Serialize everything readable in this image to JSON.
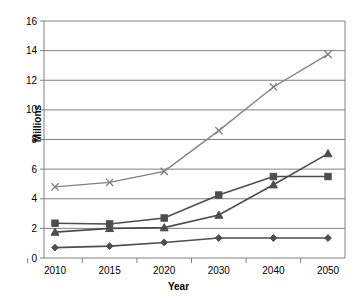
{
  "chart_data": {
    "type": "line",
    "title": "",
    "xlabel": "Year",
    "ylabel": "Millions",
    "x": [
      2010,
      2015,
      2020,
      2030,
      2040,
      2050
    ],
    "xtick_labels": [
      "2010",
      "2015",
      "2020",
      "2030",
      "2040",
      "2050"
    ],
    "ytick_labels": [
      "0",
      "2",
      "4",
      "6",
      "8",
      "10",
      "12",
      "14",
      "16"
    ],
    "ylim": [
      0,
      16
    ],
    "ytick_step": 2,
    "grid": "horizontal",
    "legend": "none",
    "series": [
      {
        "name": "series-diamond",
        "marker": "diamond",
        "color": "#4d4d4d",
        "values": [
          0.7,
          0.8,
          1.05,
          1.35,
          1.35,
          1.35
        ]
      },
      {
        "name": "series-square",
        "marker": "square",
        "color": "#4d4d4d",
        "values": [
          2.35,
          2.3,
          2.7,
          4.25,
          5.5,
          5.5
        ]
      },
      {
        "name": "series-triangle",
        "marker": "triangle",
        "color": "#4d4d4d",
        "values": [
          1.75,
          2.0,
          2.05,
          2.9,
          4.95,
          7.05
        ]
      },
      {
        "name": "series-cross",
        "marker": "x",
        "color": "#808080",
        "values": [
          4.8,
          5.1,
          5.85,
          8.6,
          11.55,
          13.75
        ]
      }
    ]
  },
  "axis": {
    "ylabel": "Millions",
    "xlabel": "Year"
  },
  "colors": {
    "axis": "#808080",
    "grid": "#808080",
    "dark_series": "#4d4d4d",
    "light_series": "#808080",
    "background": "#ffffff"
  }
}
